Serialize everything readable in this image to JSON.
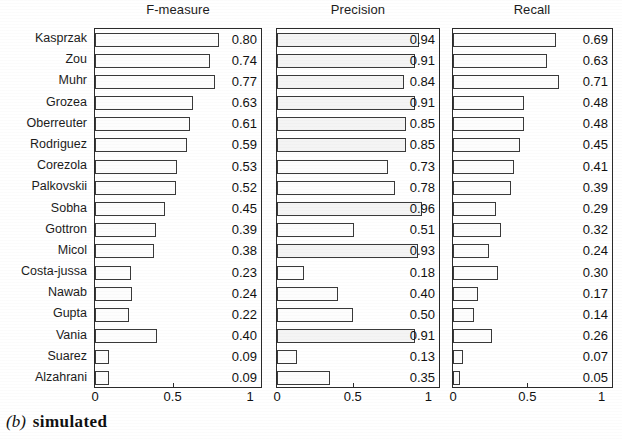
{
  "figure": {
    "caption_letter": "(b)",
    "caption_text": "simulated"
  },
  "chart_data": {
    "type": "bar",
    "orientation": "horizontal",
    "grid": false,
    "legend": null,
    "xlabel": "",
    "ylabel": "",
    "xlim": [
      0,
      1
    ],
    "xticks": [
      0,
      0.5,
      1
    ],
    "xticklabels": [
      "0",
      "0.5",
      "1"
    ],
    "categories": [
      "Kasprzak",
      "Zou",
      "Muhr",
      "Grozea",
      "Oberreuter",
      "Rodriguez",
      "Corezola",
      "Palkovskii",
      "Sobha",
      "Gottron",
      "Micol",
      "Costa-jussa",
      "Nawab",
      "Gupta",
      "Vania",
      "Suarez",
      "Alzahrani"
    ],
    "panels": [
      {
        "title": "F-measure",
        "values": [
          0.8,
          0.74,
          0.77,
          0.63,
          0.61,
          0.59,
          0.53,
          0.52,
          0.45,
          0.39,
          0.38,
          0.23,
          0.24,
          0.22,
          0.4,
          0.09,
          0.09
        ],
        "labels": [
          "0.80",
          "0.74",
          "0.77",
          "0.63",
          "0.61",
          "0.59",
          "0.53",
          "0.52",
          "0.45",
          "0.39",
          "0.38",
          "0.23",
          "0.24",
          "0.22",
          "0.40",
          "0.09",
          "0.09"
        ]
      },
      {
        "title": "Precision",
        "values": [
          0.94,
          0.91,
          0.84,
          0.91,
          0.85,
          0.85,
          0.73,
          0.78,
          0.96,
          0.51,
          0.93,
          0.18,
          0.4,
          0.5,
          0.91,
          0.13,
          0.35
        ],
        "labels": [
          "0.94",
          "0.91",
          "0.84",
          "0.91",
          "0.85",
          "0.85",
          "0.73",
          "0.78",
          "0.96",
          "0.51",
          "0.93",
          "0.18",
          "0.40",
          "0.50",
          "0.91",
          "0.13",
          "0.35"
        ]
      },
      {
        "title": "Recall",
        "values": [
          0.69,
          0.63,
          0.71,
          0.48,
          0.48,
          0.45,
          0.41,
          0.39,
          0.29,
          0.32,
          0.24,
          0.3,
          0.17,
          0.14,
          0.26,
          0.07,
          0.05
        ],
        "labels": [
          "0.69",
          "0.63",
          "0.71",
          "0.48",
          "0.48",
          "0.45",
          "0.41",
          "0.39",
          "0.29",
          "0.32",
          "0.24",
          "0.30",
          "0.17",
          "0.14",
          "0.26",
          "0.07",
          "0.05"
        ]
      }
    ],
    "colors": {
      "bar_fill": "#fdfdfd",
      "bar_edge": "#3a3a3a",
      "axis": "#2b2b2b",
      "text": "#1a1a1a"
    }
  }
}
